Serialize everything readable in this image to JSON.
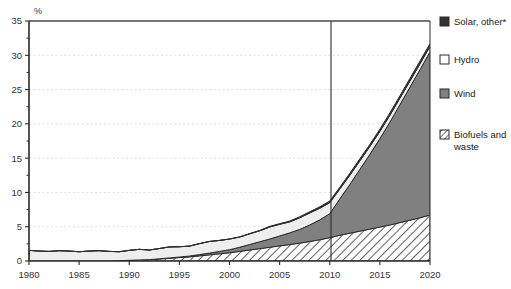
{
  "chart_data": {
    "type": "area",
    "title": "",
    "subtitle": "",
    "xlabel": "",
    "ylabel": "%",
    "xlim": [
      1980,
      2020
    ],
    "ylim": [
      0,
      35
    ],
    "ytick_step": 5,
    "xtick_step": 5,
    "grid": true,
    "stacked": true,
    "legend_position": "right",
    "projection_divider_x": 2010,
    "xticks": [
      1980,
      1985,
      1990,
      1995,
      2000,
      2005,
      2010,
      2015,
      2020
    ],
    "yticks": [
      0,
      5,
      10,
      15,
      20,
      25,
      30,
      35
    ],
    "x": [
      1980,
      1981,
      1982,
      1983,
      1984,
      1985,
      1986,
      1987,
      1988,
      1989,
      1990,
      1991,
      1992,
      1993,
      1994,
      1995,
      1996,
      1997,
      1998,
      1999,
      2000,
      2001,
      2002,
      2003,
      2004,
      2005,
      2006,
      2007,
      2008,
      2009,
      2010,
      2011,
      2012,
      2013,
      2014,
      2015,
      2016,
      2017,
      2018,
      2019,
      2020
    ],
    "series": [
      {
        "name": "Biofuels and waste",
        "key": "biofuels",
        "fill": "hatch",
        "color": "#ffffff",
        "values": [
          0.0,
          0.0,
          0.0,
          0.0,
          0.0,
          0.0,
          0.0,
          0.0,
          0.0,
          0.05,
          0.1,
          0.15,
          0.2,
          0.3,
          0.4,
          0.5,
          0.6,
          0.75,
          0.9,
          1.05,
          1.2,
          1.4,
          1.6,
          1.8,
          2.0,
          2.2,
          2.4,
          2.6,
          2.85,
          3.1,
          3.4,
          3.75,
          4.05,
          4.35,
          4.65,
          4.95,
          5.25,
          5.6,
          5.95,
          6.3,
          6.7
        ]
      },
      {
        "name": "Wind",
        "key": "wind",
        "fill": "solid",
        "color": "#808080",
        "values": [
          0.0,
          0.0,
          0.0,
          0.0,
          0.0,
          0.0,
          0.0,
          0.0,
          0.0,
          0.0,
          0.0,
          0.0,
          0.0,
          0.02,
          0.05,
          0.08,
          0.12,
          0.18,
          0.25,
          0.35,
          0.45,
          0.6,
          0.8,
          1.0,
          1.2,
          1.45,
          1.7,
          2.0,
          2.4,
          2.9,
          3.5,
          5.3,
          7.1,
          9.0,
          10.9,
          12.9,
          15.0,
          17.2,
          19.4,
          21.6,
          23.8
        ]
      },
      {
        "name": "Hydro",
        "key": "hydro",
        "fill": "solid",
        "color": "#eeeeee",
        "values": [
          1.55,
          1.45,
          1.4,
          1.5,
          1.45,
          1.35,
          1.45,
          1.5,
          1.4,
          1.3,
          1.45,
          1.55,
          1.4,
          1.5,
          1.6,
          1.5,
          1.45,
          1.6,
          1.7,
          1.6,
          1.55,
          1.5,
          1.55,
          1.6,
          1.75,
          1.7,
          1.6,
          1.7,
          1.75,
          1.7,
          1.6,
          1.45,
          1.35,
          1.25,
          1.15,
          1.05,
          1.0,
          0.95,
          0.9,
          0.85,
          0.8
        ]
      },
      {
        "name": "Solar, other*",
        "key": "solar",
        "fill": "solid",
        "color": "#333333",
        "values": [
          0.0,
          0.0,
          0.0,
          0.0,
          0.0,
          0.0,
          0.0,
          0.0,
          0.0,
          0.0,
          0.0,
          0.0,
          0.0,
          0.0,
          0.0,
          0.0,
          0.0,
          0.0,
          0.0,
          0.0,
          0.0,
          0.0,
          0.05,
          0.05,
          0.1,
          0.1,
          0.12,
          0.15,
          0.18,
          0.2,
          0.25,
          0.25,
          0.28,
          0.3,
          0.3,
          0.32,
          0.35,
          0.35,
          0.38,
          0.4,
          0.4
        ]
      }
    ],
    "totals_note": "Total reaches about 7.5% in 2010 and about 31.7% in 2020"
  },
  "legend": {
    "items": [
      {
        "label": "Solar, other*",
        "swatch": "solid-dark",
        "color": "#333333"
      },
      {
        "label": "Hydro",
        "swatch": "solid-white",
        "color": "#ffffff"
      },
      {
        "label": "Wind",
        "swatch": "solid-gray",
        "color": "#808080"
      },
      {
        "label": "Biofuels and waste",
        "swatch": "hatch",
        "color": "#ffffff"
      }
    ]
  },
  "axis": {
    "y_unit_label": "%",
    "y_tick_labels": [
      "0",
      "5",
      "10",
      "15",
      "20",
      "25",
      "30",
      "35"
    ],
    "x_tick_labels": [
      "1980",
      "1985",
      "1990",
      "1995",
      "2000",
      "2005",
      "2010",
      "2015",
      "2020"
    ]
  }
}
